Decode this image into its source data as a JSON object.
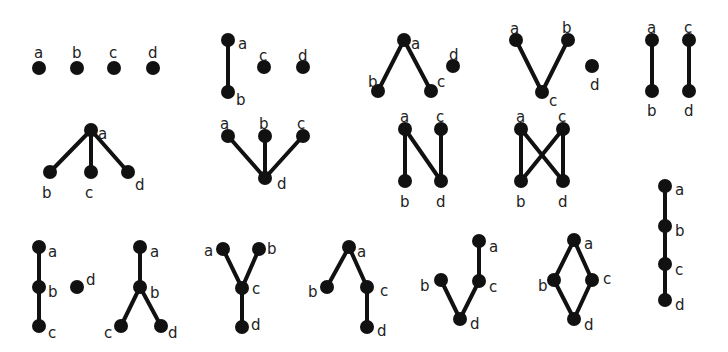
{
  "figure": {
    "width": 728,
    "height": 352,
    "node_color": "#111111",
    "edge_color": "#111111",
    "label_color": "#222222",
    "node_radius": 7,
    "edge_width": 4
  },
  "diagrams": [
    {
      "id": "poset-1",
      "nodes": [
        {
          "label": "a",
          "x": 39,
          "y": 68,
          "lx": 34,
          "ly": 53
        },
        {
          "label": "b",
          "x": 77,
          "y": 68,
          "lx": 72,
          "ly": 53
        },
        {
          "label": "c",
          "x": 114,
          "y": 68,
          "lx": 109,
          "ly": 53
        },
        {
          "label": "d",
          "x": 153,
          "y": 68,
          "lx": 148,
          "ly": 53
        }
      ],
      "edges": []
    },
    {
      "id": "poset-2",
      "nodes": [
        {
          "label": "a",
          "x": 228,
          "y": 40,
          "lx": 238,
          "ly": 44
        },
        {
          "label": "b",
          "x": 228,
          "y": 92,
          "lx": 236,
          "ly": 100
        },
        {
          "label": "c",
          "x": 264,
          "y": 67,
          "lx": 259,
          "ly": 56
        },
        {
          "label": "d",
          "x": 303,
          "y": 67,
          "lx": 298,
          "ly": 56
        }
      ],
      "edges": [
        [
          "a",
          "b"
        ]
      ]
    },
    {
      "id": "poset-3",
      "nodes": [
        {
          "label": "a",
          "x": 404,
          "y": 40,
          "lx": 411,
          "ly": 44
        },
        {
          "label": "b",
          "x": 378,
          "y": 91,
          "lx": 368,
          "ly": 82
        },
        {
          "label": "c",
          "x": 431,
          "y": 91,
          "lx": 437,
          "ly": 82
        },
        {
          "label": "d",
          "x": 453,
          "y": 66,
          "lx": 449,
          "ly": 55
        }
      ],
      "edges": [
        [
          "a",
          "b"
        ],
        [
          "a",
          "c"
        ]
      ]
    },
    {
      "id": "poset-4",
      "nodes": [
        {
          "label": "a",
          "x": 516,
          "y": 40,
          "lx": 510,
          "ly": 29
        },
        {
          "label": "b",
          "x": 568,
          "y": 40,
          "lx": 562,
          "ly": 28
        },
        {
          "label": "c",
          "x": 542,
          "y": 92,
          "lx": 549,
          "ly": 101
        },
        {
          "label": "d",
          "x": 592,
          "y": 66,
          "lx": 590,
          "ly": 85
        }
      ],
      "edges": [
        [
          "a",
          "c"
        ],
        [
          "b",
          "c"
        ]
      ]
    },
    {
      "id": "poset-5",
      "nodes": [
        {
          "label": "a",
          "x": 652,
          "y": 40,
          "lx": 647,
          "ly": 28
        },
        {
          "label": "b",
          "x": 652,
          "y": 91,
          "lx": 647,
          "ly": 111
        },
        {
          "label": "c",
          "x": 689,
          "y": 40,
          "lx": 684,
          "ly": 28
        },
        {
          "label": "d",
          "x": 689,
          "y": 91,
          "lx": 684,
          "ly": 111
        }
      ],
      "edges": [
        [
          "a",
          "b"
        ],
        [
          "c",
          "d"
        ]
      ]
    },
    {
      "id": "poset-6",
      "nodes": [
        {
          "label": "a",
          "x": 91,
          "y": 130,
          "lx": 98,
          "ly": 134
        },
        {
          "label": "b",
          "x": 50,
          "y": 172,
          "lx": 42,
          "ly": 193
        },
        {
          "label": "c",
          "x": 91,
          "y": 172,
          "lx": 85,
          "ly": 193
        },
        {
          "label": "d",
          "x": 128,
          "y": 172,
          "lx": 135,
          "ly": 185
        }
      ],
      "edges": [
        [
          "a",
          "b"
        ],
        [
          "a",
          "c"
        ],
        [
          "a",
          "d"
        ]
      ]
    },
    {
      "id": "poset-7",
      "nodes": [
        {
          "label": "a",
          "x": 228,
          "y": 136,
          "lx": 220,
          "ly": 124
        },
        {
          "label": "b",
          "x": 265,
          "y": 136,
          "lx": 259,
          "ly": 124
        },
        {
          "label": "c",
          "x": 303,
          "y": 136,
          "lx": 297,
          "ly": 124
        },
        {
          "label": "d",
          "x": 265,
          "y": 178,
          "lx": 277,
          "ly": 184
        }
      ],
      "edges": [
        [
          "a",
          "d"
        ],
        [
          "b",
          "d"
        ],
        [
          "c",
          "d"
        ]
      ]
    },
    {
      "id": "poset-8",
      "nodes": [
        {
          "label": "a",
          "x": 405,
          "y": 129,
          "lx": 400,
          "ly": 117
        },
        {
          "label": "b",
          "x": 405,
          "y": 181,
          "lx": 400,
          "ly": 202
        },
        {
          "label": "c",
          "x": 441,
          "y": 129,
          "lx": 436,
          "ly": 117
        },
        {
          "label": "d",
          "x": 441,
          "y": 181,
          "lx": 436,
          "ly": 202
        }
      ],
      "edges": [
        [
          "a",
          "b"
        ],
        [
          "a",
          "d"
        ],
        [
          "c",
          "d"
        ]
      ]
    },
    {
      "id": "poset-9",
      "nodes": [
        {
          "label": "a",
          "x": 521,
          "y": 129,
          "lx": 516,
          "ly": 117
        },
        {
          "label": "b",
          "x": 521,
          "y": 181,
          "lx": 516,
          "ly": 202
        },
        {
          "label": "c",
          "x": 563,
          "y": 129,
          "lx": 558,
          "ly": 117
        },
        {
          "label": "d",
          "x": 563,
          "y": 181,
          "lx": 558,
          "ly": 202
        }
      ],
      "edges": [
        [
          "a",
          "b"
        ],
        [
          "a",
          "d"
        ],
        [
          "c",
          "b"
        ],
        [
          "c",
          "d"
        ]
      ]
    },
    {
      "id": "poset-10",
      "nodes": [
        {
          "label": "a",
          "x": 665,
          "y": 186,
          "lx": 675,
          "ly": 190
        },
        {
          "label": "b",
          "x": 665,
          "y": 226,
          "lx": 675,
          "ly": 231
        },
        {
          "label": "c",
          "x": 665,
          "y": 264,
          "lx": 675,
          "ly": 270
        },
        {
          "label": "d",
          "x": 665,
          "y": 300,
          "lx": 675,
          "ly": 305
        }
      ],
      "edges": [
        [
          "a",
          "b"
        ],
        [
          "b",
          "c"
        ],
        [
          "c",
          "d"
        ]
      ]
    },
    {
      "id": "poset-11",
      "nodes": [
        {
          "label": "a",
          "x": 39,
          "y": 247,
          "lx": 48,
          "ly": 252
        },
        {
          "label": "b",
          "x": 39,
          "y": 287,
          "lx": 48,
          "ly": 292
        },
        {
          "label": "c",
          "x": 39,
          "y": 326,
          "lx": 48,
          "ly": 333
        },
        {
          "label": "d",
          "x": 77,
          "y": 287,
          "lx": 86,
          "ly": 280
        }
      ],
      "edges": [
        [
          "a",
          "b"
        ],
        [
          "b",
          "c"
        ]
      ]
    },
    {
      "id": "poset-12",
      "nodes": [
        {
          "label": "a",
          "x": 140,
          "y": 247,
          "lx": 150,
          "ly": 252
        },
        {
          "label": "b",
          "x": 140,
          "y": 287,
          "lx": 150,
          "ly": 293
        },
        {
          "label": "c",
          "x": 121,
          "y": 326,
          "lx": 104,
          "ly": 333
        },
        {
          "label": "d",
          "x": 161,
          "y": 326,
          "lx": 168,
          "ly": 333
        }
      ],
      "edges": [
        [
          "a",
          "b"
        ],
        [
          "b",
          "c"
        ],
        [
          "b",
          "d"
        ]
      ]
    },
    {
      "id": "poset-13",
      "nodes": [
        {
          "label": "a",
          "x": 223,
          "y": 249,
          "lx": 204,
          "ly": 251
        },
        {
          "label": "b",
          "x": 259,
          "y": 249,
          "lx": 267,
          "ly": 249
        },
        {
          "label": "c",
          "x": 242,
          "y": 288,
          "lx": 252,
          "ly": 289
        },
        {
          "label": "d",
          "x": 242,
          "y": 327,
          "lx": 251,
          "ly": 325
        }
      ],
      "edges": [
        [
          "a",
          "c"
        ],
        [
          "b",
          "c"
        ],
        [
          "c",
          "d"
        ]
      ]
    },
    {
      "id": "poset-14",
      "nodes": [
        {
          "label": "a",
          "x": 349,
          "y": 247,
          "lx": 357,
          "ly": 252
        },
        {
          "label": "b",
          "x": 327,
          "y": 287,
          "lx": 308,
          "ly": 292
        },
        {
          "label": "c",
          "x": 367,
          "y": 287,
          "lx": 380,
          "ly": 291
        },
        {
          "label": "d",
          "x": 367,
          "y": 327,
          "lx": 377,
          "ly": 331
        }
      ],
      "edges": [
        [
          "a",
          "b"
        ],
        [
          "a",
          "c"
        ],
        [
          "c",
          "d"
        ]
      ]
    },
    {
      "id": "poset-15",
      "nodes": [
        {
          "label": "a",
          "x": 479,
          "y": 241,
          "lx": 489,
          "ly": 247
        },
        {
          "label": "b",
          "x": 441,
          "y": 280,
          "lx": 420,
          "ly": 286
        },
        {
          "label": "c",
          "x": 479,
          "y": 281,
          "lx": 489,
          "ly": 287
        },
        {
          "label": "d",
          "x": 460,
          "y": 319,
          "lx": 470,
          "ly": 324
        }
      ],
      "edges": [
        [
          "a",
          "c"
        ],
        [
          "b",
          "d"
        ],
        [
          "c",
          "d"
        ]
      ]
    },
    {
      "id": "poset-16",
      "nodes": [
        {
          "label": "a",
          "x": 574,
          "y": 240,
          "lx": 584,
          "ly": 244
        },
        {
          "label": "b",
          "x": 554,
          "y": 280,
          "lx": 538,
          "ly": 286
        },
        {
          "label": "c",
          "x": 592,
          "y": 280,
          "lx": 603,
          "ly": 279
        },
        {
          "label": "d",
          "x": 574,
          "y": 319,
          "lx": 584,
          "ly": 325
        }
      ],
      "edges": [
        [
          "a",
          "b"
        ],
        [
          "a",
          "c"
        ],
        [
          "b",
          "d"
        ],
        [
          "c",
          "d"
        ]
      ]
    }
  ]
}
